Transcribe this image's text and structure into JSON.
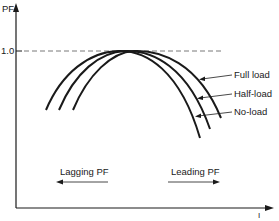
{
  "axes": {
    "y_label": "PF",
    "x_label": "I",
    "y_tick": "1.0"
  },
  "curves": [
    {
      "name": "Full load",
      "label": "Full load"
    },
    {
      "name": "Half-load",
      "label": "Half-load"
    },
    {
      "name": "No-load",
      "label": "No-load"
    }
  ],
  "annotations": {
    "lagging": "Lagging PF",
    "leading": "Leading PF"
  },
  "colors": {
    "ink": "#1a1a1a",
    "background": "#ffffff"
  }
}
